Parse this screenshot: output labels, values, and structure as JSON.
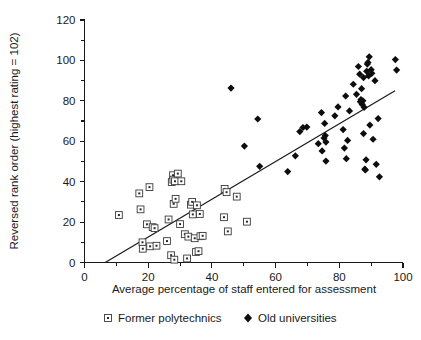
{
  "chart_data": {
    "type": "scatter",
    "title": "",
    "xlabel": "Average percentage of staff entered for assessment",
    "ylabel": "Reversed rank order (highest rating = 102)",
    "xlim": [
      0,
      100
    ],
    "ylim": [
      0,
      120
    ],
    "xticks": [
      0,
      20,
      40,
      60,
      80,
      100
    ],
    "yticks": [
      0,
      20,
      40,
      60,
      80,
      100,
      120
    ],
    "xtick_labels": [
      "0",
      "20",
      "40",
      "60",
      "80",
      "100"
    ],
    "ytick_labels": [
      "0",
      "20",
      "40",
      "60",
      "80",
      "100",
      "120"
    ],
    "minor_ticks": true,
    "grid": false,
    "legend_position": "below-axis",
    "series": [
      {
        "name": "Former polytechnics",
        "marker": "open-square-with-dot",
        "color": "#ffffff",
        "edge_color": "#3a3a3a",
        "points": [
          [
            10.8,
            23.5
          ],
          [
            17.2,
            34.2
          ],
          [
            17.6,
            26.3
          ],
          [
            18.2,
            10.0
          ],
          [
            18.3,
            6.8
          ],
          [
            19.6,
            18.9
          ],
          [
            20.4,
            37.3
          ],
          [
            20.6,
            8.0
          ],
          [
            21.4,
            17.5
          ],
          [
            22.0,
            17.0
          ],
          [
            22.6,
            8.3
          ],
          [
            25.9,
            10.6
          ],
          [
            26.4,
            21.3
          ],
          [
            27.2,
            3.6
          ],
          [
            27.4,
            39.8
          ],
          [
            27.8,
            43.2
          ],
          [
            27.9,
            41.0
          ],
          [
            28.0,
            29.0
          ],
          [
            28.2,
            1.4
          ],
          [
            28.4,
            40.2
          ],
          [
            28.6,
            31.5
          ],
          [
            29.3,
            44.0
          ],
          [
            30.0,
            19.0
          ],
          [
            30.4,
            40.2
          ],
          [
            31.5,
            14.0
          ],
          [
            32.2,
            2.0
          ],
          [
            32.6,
            12.8
          ],
          [
            33.4,
            28.6
          ],
          [
            33.8,
            30.0
          ],
          [
            34.0,
            23.8
          ],
          [
            34.6,
            12.0
          ],
          [
            35.0,
            5.2
          ],
          [
            35.3,
            28.3
          ],
          [
            35.8,
            5.6
          ],
          [
            36.2,
            24.0
          ],
          [
            36.4,
            13.0
          ],
          [
            37.1,
            13.2
          ],
          [
            43.8,
            22.4
          ],
          [
            44.0,
            36.4
          ],
          [
            44.6,
            34.8
          ],
          [
            45.0,
            15.4
          ],
          [
            47.8,
            32.6
          ],
          [
            51.0,
            20.2
          ]
        ]
      },
      {
        "name": "Old universities",
        "marker": "filled-diamond",
        "color": "#0d0d0d",
        "points": [
          [
            46.0,
            86.3
          ],
          [
            50.2,
            57.6
          ],
          [
            54.4,
            71.0
          ],
          [
            55.0,
            47.6
          ],
          [
            63.8,
            45.0
          ],
          [
            67.6,
            64.8
          ],
          [
            68.6,
            66.8
          ],
          [
            69.8,
            67.0
          ],
          [
            66.2,
            52.8
          ],
          [
            73.4,
            58.8
          ],
          [
            74.4,
            74.2
          ],
          [
            74.6,
            55.2
          ],
          [
            75.2,
            61.6
          ],
          [
            75.4,
            68.8
          ],
          [
            75.6,
            62.8
          ],
          [
            75.8,
            59.6
          ],
          [
            75.8,
            50.2
          ],
          [
            78.6,
            72.6
          ],
          [
            79.6,
            77.0
          ],
          [
            81.2,
            65.8
          ],
          [
            81.6,
            56.6
          ],
          [
            82.0,
            82.4
          ],
          [
            82.2,
            51.4
          ],
          [
            82.6,
            60.4
          ],
          [
            83.2,
            75.0
          ],
          [
            84.4,
            88.2
          ],
          [
            85.4,
            83.2
          ],
          [
            86.0,
            97.0
          ],
          [
            86.4,
            93.2
          ],
          [
            86.6,
            79.6
          ],
          [
            86.8,
            80.6
          ],
          [
            87.0,
            86.0
          ],
          [
            87.2,
            78.2
          ],
          [
            87.4,
            80.0
          ],
          [
            87.6,
            91.5
          ],
          [
            87.6,
            63.8
          ],
          [
            87.8,
            76.8
          ],
          [
            88.0,
            46.2
          ],
          [
            88.2,
            45.8
          ],
          [
            88.4,
            50.8
          ],
          [
            88.6,
            94.6
          ],
          [
            88.8,
            98.2
          ],
          [
            89.0,
            99.0
          ],
          [
            89.2,
            92.4
          ],
          [
            89.4,
            101.8
          ],
          [
            89.6,
            68.0
          ],
          [
            90.0,
            95.4
          ],
          [
            90.2,
            93.6
          ],
          [
            90.6,
            61.0
          ],
          [
            91.2,
            90.0
          ],
          [
            91.6,
            48.6
          ],
          [
            92.2,
            71.2
          ],
          [
            92.6,
            42.4
          ],
          [
            97.6,
            100.4
          ],
          [
            98.0,
            95.2
          ]
        ]
      }
    ],
    "fit_line": {
      "x_start": 6.5,
      "y_start": 0,
      "x_end": 97.5,
      "y_end": 85.0
    }
  },
  "legend": {
    "items": [
      {
        "label": "Former polytechnics",
        "marker": "open-square-with-dot"
      },
      {
        "label": "Old universities",
        "marker": "filled-diamond"
      }
    ]
  },
  "axes": {
    "x_title": "Average percentage of staff entered for assessment",
    "y_title": "Reversed rank order (highest rating = 102)"
  }
}
